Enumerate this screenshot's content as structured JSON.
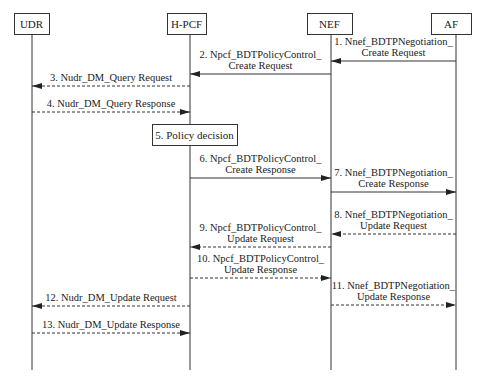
{
  "diagram": {
    "type": "sequence",
    "colors": {
      "line": "#333333",
      "background": "#ffffff",
      "text": "#222222"
    },
    "participants": [
      {
        "id": "udr",
        "label": "UDR",
        "x": 32,
        "box": [
          14,
          13,
          35,
          21
        ]
      },
      {
        "id": "hpcf",
        "label": "H-PCF",
        "x": 190,
        "box": [
          167,
          13,
          39,
          21
        ]
      },
      {
        "id": "nef",
        "label": "NEF",
        "x": 331,
        "box": [
          307,
          13,
          45,
          21
        ]
      },
      {
        "id": "af",
        "label": "AF",
        "x": 456,
        "box": [
          431,
          13,
          40,
          21
        ]
      }
    ],
    "lifeline_bottom": 370,
    "note": {
      "label": "5.  Policy decision",
      "box": [
        152,
        124,
        85,
        21
      ]
    },
    "messages": [
      {
        "n": 1,
        "from": "af",
        "to": "nef",
        "style": "solid",
        "y": 61,
        "lines": [
          "1. Nnef_BDTPNegotiation_",
          "Create Request"
        ]
      },
      {
        "n": 2,
        "from": "nef",
        "to": "hpcf",
        "style": "solid",
        "y": 74,
        "lines": [
          "2. Npcf_BDTPolicyControl_",
          "Create Request"
        ]
      },
      {
        "n": 3,
        "from": "hpcf",
        "to": "udr",
        "style": "dashed",
        "y": 86,
        "lines": [
          "3.  Nudr_DM_Query Request"
        ]
      },
      {
        "n": 4,
        "from": "udr",
        "to": "hpcf",
        "style": "dashed",
        "y": 112,
        "lines": [
          "4.  Nudr_DM_Query  Response"
        ]
      },
      {
        "n": 6,
        "from": "hpcf",
        "to": "nef",
        "style": "solid",
        "y": 178,
        "lines": [
          "6. Npcf_BDTPolicyControl_",
          "Create  Response"
        ]
      },
      {
        "n": 7,
        "from": "nef",
        "to": "af",
        "style": "solid",
        "y": 192,
        "lines": [
          "7. Nnef_BDTPNegotiation_",
          "Create Response"
        ]
      },
      {
        "n": 8,
        "from": "af",
        "to": "nef",
        "style": "dashed",
        "y": 234,
        "lines": [
          "8. Nnef_BDTPNegotiation_",
          "Update  Request"
        ]
      },
      {
        "n": 9,
        "from": "nef",
        "to": "hpcf",
        "style": "dashed",
        "y": 247,
        "lines": [
          "9. Npcf_BDTPolicyControl_",
          "Update Request"
        ]
      },
      {
        "n": 10,
        "from": "hpcf",
        "to": "nef",
        "style": "dashed",
        "y": 278,
        "lines": [
          "10. Npcf_BDTPolicyControl_",
          "Update Response"
        ]
      },
      {
        "n": 11,
        "from": "nef",
        "to": "af",
        "style": "dashed",
        "y": 305,
        "lines": [
          "11. Nnef_BDTPNegotiation_",
          "Update  Response"
        ]
      },
      {
        "n": 12,
        "from": "hpcf",
        "to": "udr",
        "style": "dashed",
        "y": 306,
        "lines": [
          "12. Nudr_DM_Update Request"
        ]
      },
      {
        "n": 13,
        "from": "udr",
        "to": "hpcf",
        "style": "dashed",
        "y": 333,
        "lines": [
          "13. Nudr_DM_Update  Response"
        ]
      }
    ]
  }
}
